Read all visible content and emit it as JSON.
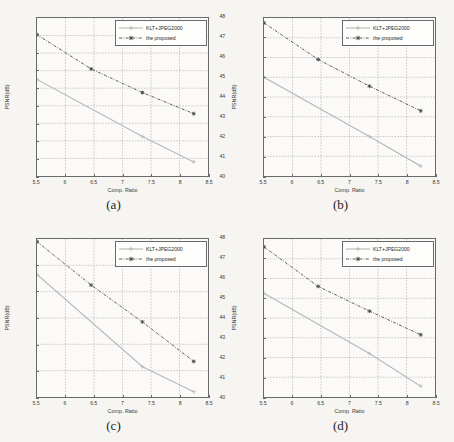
{
  "figure": {
    "background_color": "#f6f5f2",
    "axis_color": "#6a6a6a",
    "grid_color": "#9a9a9a",
    "series_colors": {
      "klt_jpeg2000": "#b9b9b9",
      "proposed": "#4a4a4a"
    },
    "xlabel": "Comp. Ratio",
    "ylabel": "PSNR(dB)",
    "legend_labels": {
      "klt_jpeg2000": "KLT+JPEG2000",
      "proposed": "the proposed"
    },
    "xticks": [
      "5.5",
      "6",
      "6.5",
      "7",
      "7.5",
      "8",
      "8.5"
    ],
    "xlim": [
      5.5,
      8.5
    ]
  },
  "chart_data": [
    {
      "type": "line",
      "panel": "a",
      "caption": "(a)",
      "title": "",
      "xlabel": "Comp. Ratio",
      "ylabel": "PSNR(dB)",
      "xlim": [
        5.5,
        8.5
      ],
      "ylim": [
        40,
        49
      ],
      "xticks": [
        5.5,
        6,
        6.5,
        7,
        7.5,
        8,
        8.5
      ],
      "yticks": [
        40,
        41,
        42,
        43,
        44,
        45,
        46,
        47,
        48,
        49
      ],
      "ytick_labels": [
        "40",
        "41",
        "42",
        "43",
        "44",
        "45",
        "46",
        "47",
        "48",
        "49"
      ],
      "grid": true,
      "legend_position": "upper right",
      "series": [
        {
          "name": "KLT+JPEG2000",
          "style": "solid",
          "marker": "plus",
          "color": "#b9b9b9",
          "x": [
            5.5,
            7.35,
            8.25
          ],
          "values": [
            45.5,
            42.25,
            40.8
          ]
        },
        {
          "name": "the proposed",
          "style": "dashdot",
          "marker": "star",
          "color": "#4a4a4a",
          "x": [
            5.5,
            6.45,
            7.35,
            8.25
          ],
          "values": [
            48.05,
            46.1,
            44.75,
            43.55
          ]
        }
      ]
    },
    {
      "type": "line",
      "panel": "b",
      "caption": "(b)",
      "title": "",
      "xlabel": "Comp. Ratio",
      "ylabel": "PSNR(dB)",
      "xlim": [
        5.5,
        8.5
      ],
      "ylim": [
        40,
        48
      ],
      "xticks": [
        5.5,
        6,
        6.5,
        7,
        7.5,
        8,
        8.5
      ],
      "yticks": [
        40,
        41,
        42,
        43,
        44,
        45,
        46,
        47,
        48
      ],
      "ytick_labels": [
        "40",
        "41",
        "42",
        "43",
        "44",
        "45",
        "46",
        "47",
        "48"
      ],
      "grid": true,
      "legend_position": "upper right",
      "series": [
        {
          "name": "KLT+JPEG2000",
          "style": "solid",
          "marker": "plus",
          "color": "#b9b9b9",
          "x": [
            5.5,
            7.35,
            8.25
          ],
          "values": [
            45.0,
            42.0,
            40.5
          ]
        },
        {
          "name": "the proposed",
          "style": "dashdot",
          "marker": "star",
          "color": "#4a4a4a",
          "x": [
            5.5,
            6.45,
            7.35,
            8.25
          ],
          "values": [
            47.75,
            45.9,
            44.55,
            43.3
          ]
        }
      ]
    },
    {
      "type": "line",
      "panel": "c",
      "caption": "(c)",
      "title": "",
      "xlabel": "Comp. Ratio",
      "ylabel": "PSNR(dB)",
      "xlim": [
        5.5,
        8.5
      ],
      "ylim": [
        45,
        51
      ],
      "xticks": [
        5.5,
        6,
        6.5,
        7,
        7.5,
        8,
        8.5
      ],
      "yticks": [
        45,
        46,
        47,
        48,
        49,
        50,
        51
      ],
      "ytick_labels": [
        "45",
        "46",
        "47",
        "48",
        "49",
        "50",
        "51"
      ],
      "grid": true,
      "legend_position": "upper right",
      "series": [
        {
          "name": "KLT+JPEG2000",
          "style": "solid",
          "marker": "plus",
          "color": "#b9b9b9",
          "x": [
            5.5,
            7.35,
            8.25
          ],
          "values": [
            49.65,
            46.15,
            45.2
          ]
        },
        {
          "name": "the proposed",
          "style": "dashdot",
          "marker": "star",
          "color": "#4a4a4a",
          "x": [
            5.5,
            6.45,
            7.35,
            8.25
          ],
          "values": [
            50.9,
            49.25,
            47.85,
            46.35
          ]
        }
      ]
    },
    {
      "type": "line",
      "panel": "d",
      "caption": "(d)",
      "title": "",
      "xlabel": "Comp. Ratio",
      "ylabel": "PSNR(dB)",
      "xlim": [
        5.5,
        8.5
      ],
      "ylim": [
        40,
        48
      ],
      "xticks": [
        5.5,
        6,
        6.5,
        7,
        7.5,
        8,
        8.5
      ],
      "yticks": [
        40,
        41,
        42,
        43,
        44,
        45,
        46,
        47,
        48
      ],
      "ytick_labels": [
        "40",
        "41",
        "42",
        "43",
        "44",
        "45",
        "46",
        "47",
        "48"
      ],
      "grid": true,
      "legend_position": "upper right",
      "series": [
        {
          "name": "KLT+JPEG2000",
          "style": "solid",
          "marker": "plus",
          "color": "#b9b9b9",
          "x": [
            5.5,
            7.35,
            8.25
          ],
          "values": [
            45.25,
            42.2,
            40.55
          ]
        },
        {
          "name": "the proposed",
          "style": "dashdot",
          "marker": "star",
          "color": "#4a4a4a",
          "x": [
            5.5,
            6.45,
            7.35,
            8.25
          ],
          "values": [
            47.6,
            45.6,
            44.35,
            43.15
          ]
        }
      ]
    }
  ]
}
